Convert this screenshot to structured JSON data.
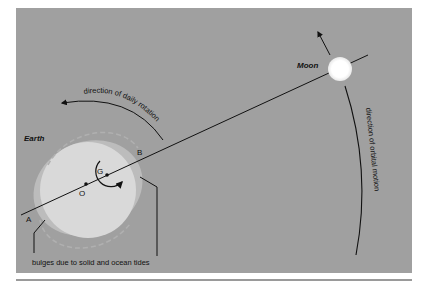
{
  "diagram": {
    "labels": {
      "earth": "Earth",
      "moon": "Moon",
      "point_a": "A",
      "point_b": "B",
      "point_g": "G",
      "point_o": "O",
      "daily_rotation": "direction of daily rotation",
      "orbital_motion": "direction of orbital motion",
      "bulges": "bulges due to solid and ocean tides"
    },
    "colors": {
      "panel": "#a0a0a0",
      "earth_fill": "#d9d9d9",
      "bulge_fill": "#bcbcbc",
      "moon_fill": "#ffffff",
      "line": "#111111"
    }
  }
}
